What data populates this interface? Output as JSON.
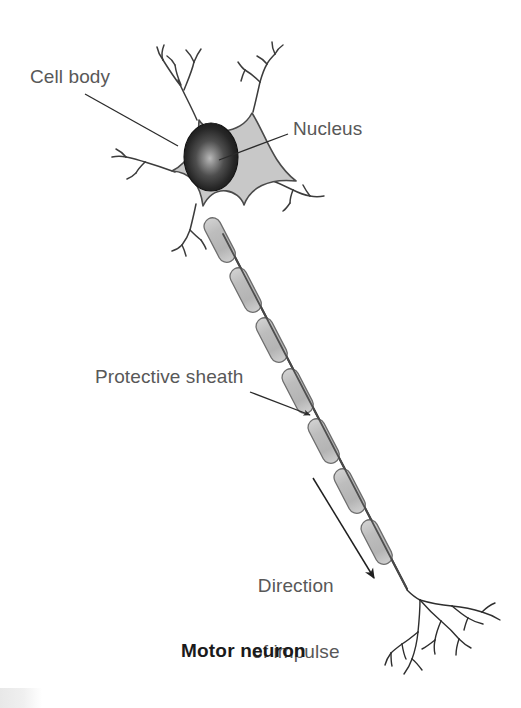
{
  "figure": {
    "title": "Motor neuron",
    "background_color": "#ffffff",
    "label_color": "#585858",
    "title_color": "#1a1a1a",
    "soma_fill": "#c8c8c8",
    "soma_stroke": "#4a4a4a",
    "nucleus_color": "#1d1d1d",
    "sheath_fill": "#bcbcbc",
    "sheath_stroke": "#6e6e6e",
    "axon_color": "#3a3a3a",
    "leader_color": "#2b2b2b"
  },
  "labels": {
    "cell_body": "Cell body",
    "nucleus": "Nucleus",
    "protective_sheath": "Protective sheath",
    "direction_line1": "Direction",
    "direction_line2": "of impulse"
  },
  "diagram": {
    "type": "biological-illustration",
    "subject": "motor neuron",
    "parts": [
      "cell body (soma)",
      "nucleus",
      "dendrites",
      "axon",
      "protective sheath (myelin)",
      "axon terminals"
    ],
    "soma_center": [
      222,
      155
    ],
    "nucleus_center": [
      211,
      157
    ],
    "axon_start": [
      222,
      232
    ],
    "axon_end": [
      408,
      590
    ],
    "sheath_segment_count": 7,
    "dendrite_count": 5,
    "impulse_arrow_from": [
      313,
      478
    ],
    "impulse_arrow_to": [
      376,
      582
    ]
  },
  "leaders": {
    "cell_body": {
      "from": [
        85,
        94
      ],
      "to": [
        178,
        146
      ]
    },
    "nucleus": {
      "from": [
        288,
        134
      ],
      "to": [
        219,
        160
      ]
    },
    "protective_sheath": {
      "from": [
        250,
        392
      ],
      "to": [
        312,
        416
      ]
    }
  }
}
